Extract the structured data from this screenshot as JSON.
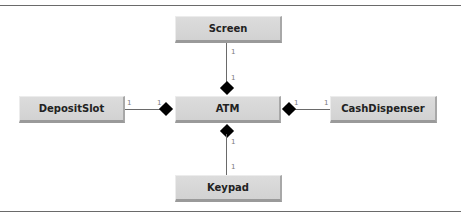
{
  "diagram": {
    "type": "UML class diagram (composition)",
    "classes": {
      "screen": "Screen",
      "atm": "ATM",
      "deposit_slot": "DepositSlot",
      "cash_dispenser": "CashDispenser",
      "keypad": "Keypad"
    },
    "associations": [
      {
        "whole": "ATM",
        "part": "Screen",
        "whole_multiplicity": "1",
        "part_multiplicity": "1",
        "kind": "composition"
      },
      {
        "whole": "ATM",
        "part": "DepositSlot",
        "whole_multiplicity": "1",
        "part_multiplicity": "1",
        "kind": "composition"
      },
      {
        "whole": "ATM",
        "part": "CashDispenser",
        "whole_multiplicity": "1",
        "part_multiplicity": "1",
        "kind": "composition"
      },
      {
        "whole": "ATM",
        "part": "Keypad",
        "whole_multiplicity": "1",
        "part_multiplicity": "1",
        "kind": "composition"
      }
    ],
    "multiplicity": {
      "screen_part": "1",
      "screen_whole": "1",
      "deposit_part": "1",
      "deposit_whole": "1",
      "cash_whole": "1",
      "cash_part": "1",
      "keypad_whole": "1",
      "keypad_part": "1"
    },
    "colors": {
      "box_fill": "#d6d6d6",
      "box_shadow": "#9a9a9a",
      "line": "#6a6a6a",
      "diamond": "#000000",
      "text": "#222222"
    }
  }
}
